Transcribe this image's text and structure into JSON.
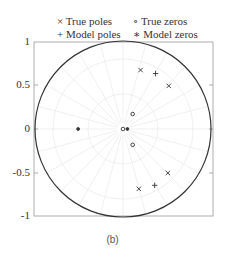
{
  "chart_data": {
    "type": "scatter",
    "title": "",
    "subtitle": "",
    "caption": "(b)",
    "xlabel": "",
    "ylabel": "",
    "xlim": [
      -1,
      1
    ],
    "ylim": [
      -1,
      1
    ],
    "yticks": [
      "1",
      "0.5",
      "0",
      "-0.5",
      "-1"
    ],
    "grid": "polar (faint)",
    "unit_circle": true,
    "legend": [
      "× True poles",
      "∘ True zeros",
      "+ Model poles",
      "∗ Model zeros"
    ],
    "legend_position": "top",
    "series": [
      {
        "name": "True poles",
        "marker": "x",
        "points": [
          [
            0.2,
            0.67
          ],
          [
            0.52,
            0.49
          ],
          [
            0.18,
            -0.68
          ],
          [
            0.51,
            -0.5
          ]
        ]
      },
      {
        "name": "True zeros",
        "marker": "o",
        "points": [
          [
            0.11,
            0.17
          ],
          [
            0.11,
            -0.18
          ],
          [
            0.0,
            0.0
          ]
        ]
      },
      {
        "name": "Model poles",
        "marker": "+",
        "points": [
          [
            0.37,
            0.63
          ],
          [
            0.36,
            -0.64
          ]
        ]
      },
      {
        "name": "Model zeros",
        "marker": "*",
        "points": [
          [
            -0.51,
            0.0
          ],
          [
            0.05,
            0.0
          ]
        ]
      }
    ]
  },
  "legend": {
    "true_poles": "× True poles",
    "true_zeros": "∘ True zeros",
    "model_poles": "+ Model poles",
    "model_zeros": "∗ Model zeros"
  },
  "axis": {
    "y1": "1",
    "y05": "0.5",
    "y0": "0",
    "ym05": "-0.5",
    "ym1": "-1"
  },
  "caption": "(b)"
}
